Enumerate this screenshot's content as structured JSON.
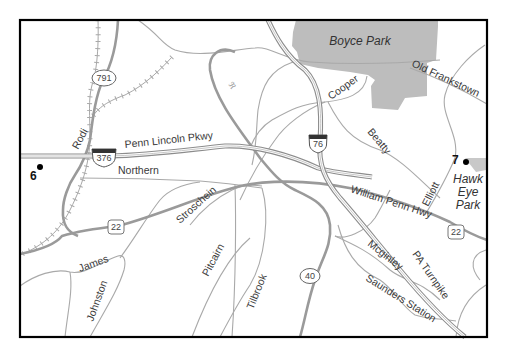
{
  "map": {
    "parks": [
      {
        "name": "Boyce Park"
      },
      {
        "name": "Hawk Eye Park",
        "lines": [
          "Hawk",
          "Eye",
          "Park"
        ]
      }
    ],
    "markers": [
      {
        "number": "6"
      },
      {
        "number": "7"
      }
    ],
    "roads": {
      "penn_lincoln": "Penn Lincoln Pkwy",
      "northern": "Northern",
      "rodi": "Rodi",
      "cooper": "Cooper",
      "old_frankstown": "Old Frankstown",
      "beatty": "Beatty",
      "elliott": "Elliott",
      "william_penn": "William Penn Hwy",
      "stroschein": "Stroschein",
      "james": "James",
      "johnston": "Johnston",
      "pitcairn": "Pitcairn",
      "tilbrook": "Tilbrook",
      "mcginley": "Mcginley",
      "pa_turnpike": "PA Turnpike",
      "saunders_station": "Saunders Station"
    },
    "shields": {
      "i376": "376",
      "i76": "76",
      "us22_west": "22",
      "us22_east": "22",
      "sr791": "791",
      "sr40": "40"
    },
    "colors": {
      "park_fill": "#b8b8b8",
      "road": "#a9a9a9",
      "route": "#9a9a9a",
      "frame": "#000000"
    }
  }
}
